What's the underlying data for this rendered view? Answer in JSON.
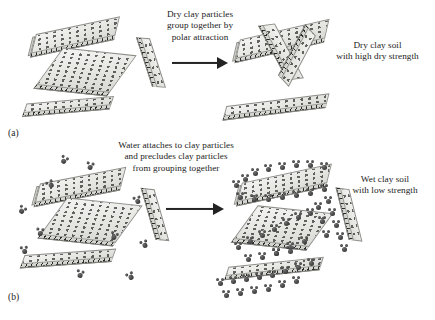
{
  "figure": {
    "background_color": "#ffffff",
    "ink_color": "#1b1b1b",
    "platelet_color": "#e6e6e3",
    "water_color": "#454545",
    "arrow_color": "#232323"
  },
  "panels": [
    {
      "id": "a",
      "label": "(a)",
      "state": "dry",
      "process_caption": {
        "line1": "Dry clay particles",
        "line2": "group together by",
        "line3": "polar attraction"
      },
      "result_caption": {
        "line1": "Dry clay soil",
        "line2": "with high dry strength"
      },
      "arrow": {
        "direction": "right",
        "name": "process-arrow"
      },
      "left_state": "dispersed randomly oriented clay platelets",
      "right_state": "platelets grouped into a rigid edge-to-face aggregate",
      "particle_count_left": 4,
      "particle_count_right": 4,
      "water_molecule_count": 0
    },
    {
      "id": "b",
      "label": "(b)",
      "state": "wet",
      "process_caption": {
        "line1": "Water attaches to clay particles",
        "line2": "and precludes clay particles",
        "line3": "from grouping together"
      },
      "result_caption": {
        "line1": "Wet clay soil",
        "line2": "with low strength"
      },
      "arrow": {
        "direction": "right",
        "name": "process-arrow"
      },
      "left_state": "clay platelets with free water molecules between them",
      "right_state": "platelets fully coated by adsorbed water, kept apart",
      "particle_count_left": 4,
      "particle_count_right": 4,
      "water_molecule_count": 11
    }
  ],
  "legend_semantics": {
    "minus_marks": "negative charge on clay platelet faces",
    "plus_marks": "positive charge along clay platelet edges",
    "water_glyph": "water molecule (one oxygen, two hydrogen)"
  }
}
